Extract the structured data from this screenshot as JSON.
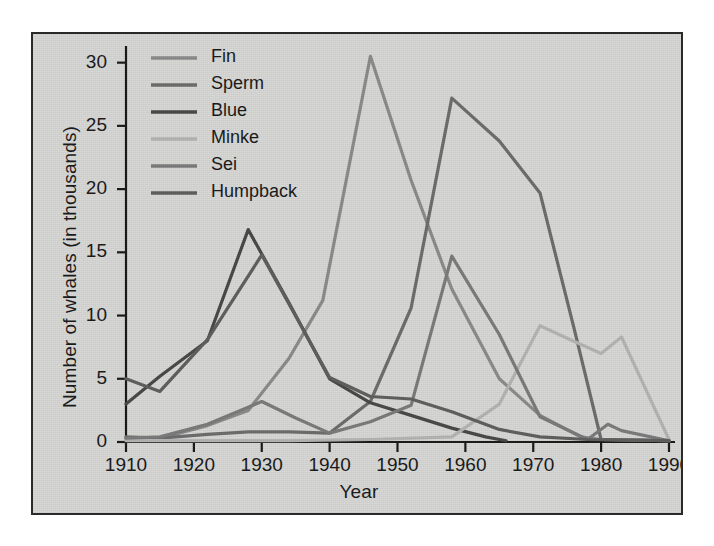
{
  "figure": {
    "background_color": "#d8d8d6",
    "border_color": "#2a2a2a"
  },
  "axes": {
    "x_title": "Year",
    "y_title": "Number of whales (in thousands)",
    "x_ticks": [
      "1910",
      "1920",
      "1930",
      "1940",
      "1950",
      "1960",
      "1970",
      "1980",
      "1990"
    ],
    "y_ticks": [
      "0",
      "5",
      "10",
      "15",
      "20",
      "25",
      "30"
    ]
  },
  "legend": {
    "entries": [
      {
        "label": "Fin",
        "color": "#8c8c8c"
      },
      {
        "label": "Sperm",
        "color": "#6e6e6e"
      },
      {
        "label": "Blue",
        "color": "#4a4a4a"
      },
      {
        "label": "Minke",
        "color": "#b5b5b5"
      },
      {
        "label": "Sei",
        "color": "#7c7c7c"
      },
      {
        "label": "Humpback",
        "color": "#606060"
      }
    ]
  },
  "chart_data": {
    "type": "line",
    "title": "",
    "xlabel": "Year",
    "ylabel": "Number of whales (in thousands)",
    "xlim": [
      1910,
      1990
    ],
    "ylim": [
      0,
      31
    ],
    "grid": false,
    "legend_position": "top-left",
    "xticks": [
      1910,
      1920,
      1930,
      1940,
      1950,
      1960,
      1970,
      1980,
      1990
    ],
    "yticks": [
      0,
      5,
      10,
      15,
      20,
      25,
      30
    ],
    "series": [
      {
        "name": "Fin",
        "color": "#8c8c8c",
        "x": [
          1910,
          1915,
          1922,
          1928,
          1934,
          1939,
          1946,
          1952,
          1958,
          1965,
          1971,
          1977,
          1980,
          1990
        ],
        "y": [
          0.3,
          0.3,
          1.3,
          2.5,
          6.6,
          11.2,
          30.5,
          20.7,
          12.1,
          5.0,
          2.1,
          0.4,
          0.2,
          0.1
        ]
      },
      {
        "name": "Sperm",
        "color": "#6e6e6e",
        "x": [
          1910,
          1915,
          1922,
          1928,
          1934,
          1940,
          1946,
          1952,
          1958,
          1965,
          1971,
          1976,
          1980,
          1990
        ],
        "y": [
          0.4,
          0.3,
          0.6,
          0.8,
          0.8,
          0.7,
          3.2,
          10.6,
          27.2,
          23.8,
          19.7,
          9.0,
          0.2,
          0.1
        ]
      },
      {
        "name": "Blue",
        "color": "#4a4a4a",
        "x": [
          1910,
          1915,
          1922,
          1928,
          1934,
          1940,
          1946,
          1952,
          1958,
          1963,
          1966
        ],
        "y": [
          3.0,
          5.2,
          8.0,
          16.8,
          11.0,
          5.0,
          3.1,
          2.1,
          1.1,
          0.4,
          0.1
        ]
      },
      {
        "name": "Minke",
        "color": "#b5b5b5",
        "x": [
          1910,
          1922,
          1934,
          1946,
          1958,
          1965,
          1971,
          1975,
          1980,
          1983,
          1990
        ],
        "y": [
          0.1,
          0.1,
          0.1,
          0.2,
          0.4,
          3.0,
          9.2,
          8.2,
          7.0,
          8.3,
          0.2
        ]
      },
      {
        "name": "Sei",
        "color": "#7c7c7c",
        "x": [
          1910,
          1915,
          1922,
          1930,
          1935,
          1940,
          1946,
          1952,
          1958,
          1965,
          1971,
          1978,
          1981,
          1983,
          1990
        ],
        "y": [
          0.3,
          0.4,
          1.4,
          3.2,
          1.9,
          0.7,
          1.6,
          2.9,
          14.7,
          8.5,
          2.0,
          0.2,
          1.4,
          0.9,
          0.1
        ]
      },
      {
        "name": "Humpback",
        "color": "#606060",
        "x": [
          1910,
          1915,
          1922,
          1930,
          1936,
          1940,
          1946,
          1952,
          1958,
          1965,
          1971,
          1978,
          1990
        ],
        "y": [
          5.0,
          4.0,
          8.1,
          14.8,
          9.0,
          5.1,
          3.6,
          3.4,
          2.4,
          1.0,
          0.4,
          0.2,
          0.1
        ]
      }
    ]
  }
}
